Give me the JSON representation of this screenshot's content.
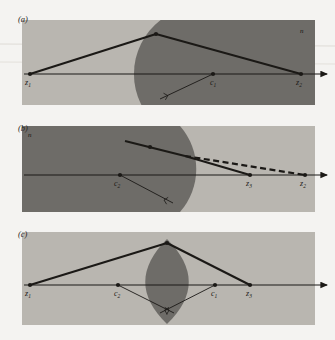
{
  "figure": {
    "caption_panels": [
      "(a)",
      "(b)",
      "(c)"
    ],
    "background_color": "#f4f3f1",
    "light_medium_color": "#b9b6b0",
    "dark_medium_color": "#6e6c68",
    "line_color": "#1b1916"
  },
  "panels": [
    {
      "id": "a",
      "label": "(a)",
      "medium_label": "n",
      "medium_label_pos": {
        "x": 300,
        "y": 33
      },
      "rect": {
        "x": 22,
        "y": 20,
        "w": 293,
        "h": 85
      },
      "axis_y": 74,
      "surface": {
        "type": "convex-arc",
        "center_x": 213,
        "center_y": 74,
        "radius": 68
      },
      "points": [
        {
          "name": "z1",
          "base": "z",
          "sub": "1",
          "x": 30,
          "y": 74,
          "label_x": 25,
          "label_y": 85
        },
        {
          "name": "c1",
          "base": "c",
          "sub": "1",
          "x": 213,
          "y": 74,
          "label_x": 210,
          "label_y": 85
        },
        {
          "name": "z2",
          "base": "z",
          "sub": "2",
          "x": 301,
          "y": 74,
          "label_x": 296,
          "label_y": 85
        }
      ],
      "vertex": {
        "x": 156,
        "y": 34
      },
      "rays": [
        {
          "from": "z1",
          "to": "vertex"
        },
        {
          "from": "vertex",
          "to": "z2"
        }
      ],
      "normal_line": {
        "x1": 213,
        "y1": 74,
        "x2": 160,
        "y2": 99
      },
      "right_angle_mark": true
    },
    {
      "id": "b",
      "label": "(b)",
      "medium_label": "n",
      "medium_label_pos": {
        "x": 30,
        "y": 134
      },
      "rect": {
        "x": 22,
        "y": 126,
        "w": 293,
        "h": 86
      },
      "axis_y": 175,
      "surface": {
        "type": "concave-arc",
        "center_x": 120,
        "center_y": 175,
        "radius": 65
      },
      "points": [
        {
          "name": "c2",
          "base": "c",
          "sub": "2",
          "x": 120,
          "y": 175,
          "label_x": 117,
          "label_y": 186
        },
        {
          "name": "z3",
          "base": "z",
          "sub": "3",
          "x": 250,
          "y": 175,
          "label_x": 246,
          "label_y": 186
        },
        {
          "name": "z2",
          "base": "z",
          "sub": "2",
          "x": 305,
          "y": 175,
          "label_x": 300,
          "label_y": 186
        }
      ],
      "incident_start": {
        "x": 125,
        "y": 141
      },
      "interface_point": {
        "x": 185,
        "y": 156
      },
      "rays": [
        {
          "from": "incident_start",
          "to": "interface_point"
        },
        {
          "from": "interface_point",
          "to": "z3"
        }
      ],
      "dashed_ray": {
        "x1": 185,
        "y1": 156,
        "x2": 305,
        "y2": 175
      },
      "normal_line": {
        "x1": 120,
        "y1": 175,
        "x2": 173,
        "y2": 203
      },
      "right_angle_mark": true
    },
    {
      "id": "c",
      "label": "(c)",
      "rect": {
        "x": 22,
        "y": 232,
        "w": 293,
        "h": 93
      },
      "axis_y": 285,
      "lens": {
        "type": "biconvex",
        "cx": 167,
        "top_y": 240,
        "bottom_y": 323,
        "half_width": 19
      },
      "points": [
        {
          "name": "z1",
          "base": "z",
          "sub": "1",
          "x": 30,
          "y": 285,
          "label_x": 25,
          "label_y": 296
        },
        {
          "name": "c2",
          "base": "c",
          "sub": "2",
          "x": 118,
          "y": 285,
          "label_x": 114,
          "label_y": 296
        },
        {
          "name": "c1",
          "base": "c",
          "sub": "1",
          "x": 215,
          "y": 285,
          "label_x": 211,
          "label_y": 296
        },
        {
          "name": "z3",
          "base": "z",
          "sub": "3",
          "x": 250,
          "y": 285,
          "label_x": 246,
          "label_y": 296
        }
      ],
      "vertex": {
        "x": 167,
        "y": 243
      },
      "rays": [
        {
          "from": "z1",
          "to": "vertex"
        },
        {
          "from": "vertex",
          "to": "z3"
        }
      ],
      "normal_lines": [
        {
          "x1": 118,
          "y1": 285,
          "x2": 172,
          "y2": 312
        },
        {
          "x1": 215,
          "y1": 285,
          "x2": 162,
          "y2": 312
        }
      ],
      "right_angle_mark": true
    }
  ]
}
